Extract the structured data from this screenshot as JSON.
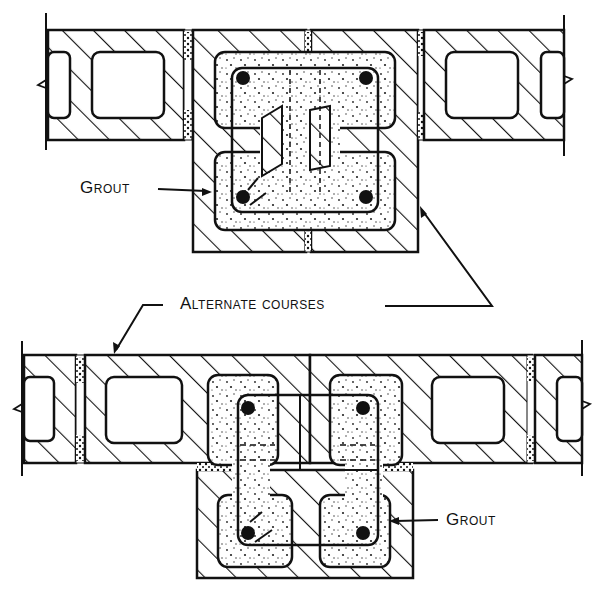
{
  "diagram": {
    "type": "masonry-block-pilaster-plan",
    "colors": {
      "line": "#111111",
      "background": "#ffffff",
      "grout_dots": "#222222"
    },
    "top_view": {
      "name": "course-1",
      "grout_label": "Grout",
      "rebar_count": 4
    },
    "bottom_view": {
      "name": "course-2",
      "grout_label": "Grout",
      "rebar_count": 4
    },
    "callout": {
      "alternate_courses_label": "Alternate courses"
    }
  }
}
